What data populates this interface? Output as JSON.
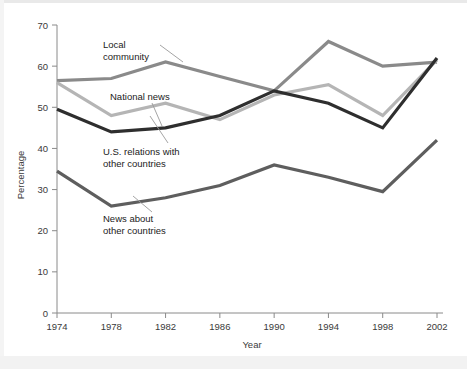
{
  "chart_data": {
    "type": "line",
    "title": "",
    "xlabel": "Year",
    "ylabel": "Percentage",
    "x": [
      1974,
      1978,
      1982,
      1986,
      1990,
      1994,
      1998,
      2002
    ],
    "categories": [
      "1974",
      "1978",
      "1982",
      "1986",
      "1990",
      "1994",
      "1998",
      "2002"
    ],
    "xlim": [
      1972,
      2004
    ],
    "ylim": [
      0,
      70
    ],
    "yticks": [
      0,
      10,
      20,
      30,
      40,
      50,
      60,
      70
    ],
    "ytick_labels": [
      "0",
      "10",
      "20",
      "30",
      "40",
      "50",
      "60",
      "70"
    ],
    "grid": false,
    "legend": "annotations-inline",
    "series": [
      {
        "name": "Local community",
        "color": "#8a8a8a",
        "values": [
          56.5,
          57.0,
          61.0,
          57.5,
          54.0,
          66.0,
          60.0,
          61.0
        ]
      },
      {
        "name": "National news",
        "color": "#b5b5b5",
        "values": [
          56.0,
          48.0,
          51.0,
          47.0,
          53.0,
          55.5,
          48.0,
          61.5
        ]
      },
      {
        "name": "U.S. relations with other countries",
        "color": "#2e2e2e",
        "values": [
          49.5,
          44.0,
          45.0,
          48.0,
          54.0,
          51.0,
          45.0,
          62.0
        ]
      },
      {
        "name": "News about other countries",
        "color": "#5e5e5e",
        "values": [
          34.5,
          26.0,
          28.0,
          31.0,
          36.0,
          33.0,
          29.5,
          42.0
        ]
      }
    ],
    "annotations": [
      {
        "id": "local-community",
        "lines": [
          "Local",
          "community"
        ],
        "x": 103,
        "y": 48
      },
      {
        "id": "national-news",
        "lines": [
          "National news"
        ],
        "x": 110,
        "y": 100
      },
      {
        "id": "us-relations",
        "lines": [
          "U.S. relations with",
          "other countries"
        ],
        "x": 103,
        "y": 155
      },
      {
        "id": "news-other",
        "lines": [
          "News about",
          "other countries"
        ],
        "x": 103,
        "y": 222
      }
    ]
  },
  "axes": {
    "y_title": "Percentage",
    "x_title": "Year"
  }
}
